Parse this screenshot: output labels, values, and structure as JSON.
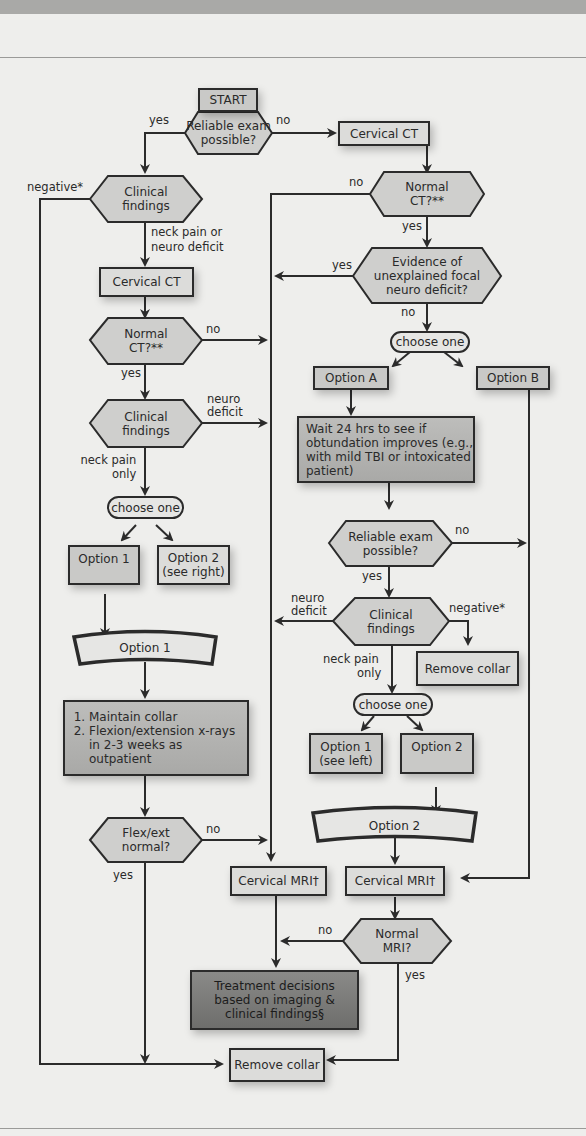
{
  "flowchart": {
    "start": "START",
    "reliable_exam_1": [
      "Reliable exam",
      "possible?"
    ],
    "cervical_ct_right": "Cervical CT",
    "normal_ct_right": [
      "Normal",
      "CT?**"
    ],
    "clinical_findings_1": [
      "Clinical",
      "findings"
    ],
    "cervical_ct_left": "Cervical CT",
    "normal_ct_left": [
      "Normal",
      "CT?**"
    ],
    "evidence_focal": [
      "Evidence of",
      "unexplained focal",
      "neuro deficit?"
    ],
    "choose_one_right": "choose one",
    "option_a": "Option A",
    "option_b": "Option B",
    "wait_24": "Wait 24 hrs to see if obtundation improves (e.g., with mild TBI or intoxicated patient)",
    "clinical_findings_2": [
      "Clinical",
      "findings"
    ],
    "choose_one_left": "choose one",
    "option_1_left": "Option 1",
    "option_2_left": [
      "Option 2",
      "(see right)"
    ],
    "option_1_banner": "Option 1",
    "maintain_steps": [
      "Maintain collar",
      "Flexion/extension x-rays in 2-3 weeks as outpatient"
    ],
    "reliable_exam_2": [
      "Reliable exam",
      "possible?"
    ],
    "clinical_findings_3": [
      "Clinical",
      "findings"
    ],
    "remove_collar_right": "Remove collar",
    "choose_one_mid": "choose one",
    "option_1_mid": [
      "Option 1",
      "(see left)"
    ],
    "option_2_mid": "Option 2",
    "option_2_banner": "Option 2",
    "flex_ext": [
      "Flex/ext",
      "normal?"
    ],
    "cervical_mri_left": "Cervical MRI†",
    "cervical_mri_right": "Cervical MRI†",
    "normal_mri": [
      "Normal",
      "MRI?"
    ],
    "treatment": [
      "Treatment decisions",
      "based on imaging &",
      "clinical findings§"
    ],
    "remove_collar_bottom": "Remove collar"
  },
  "edge_labels": {
    "yes": "yes",
    "no": "no",
    "negative": "negative*",
    "neck_pain_or_neuro": [
      "neck pain or",
      "neuro deficit"
    ],
    "neuro_deficit": [
      "neuro",
      "deficit"
    ],
    "neck_pain_only": [
      "neck pain",
      "only"
    ]
  },
  "colors": {
    "background": "#eeeeec",
    "line": "#2b2b2b",
    "box_fill": "#c9c9c7",
    "dark_box_fill": "#7c7c7a"
  }
}
